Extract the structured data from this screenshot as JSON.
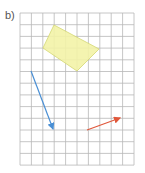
{
  "label": "b)",
  "grid": {
    "x0": 20,
    "y0": 13,
    "cols": 10,
    "rows": 13,
    "cell_w": 11.4,
    "cell_h": 11.7,
    "line_color": "#b8b8b8"
  },
  "shape": {
    "type": "quadrilateral",
    "points": "54,25 99,49 77,71 43,48",
    "fill": "#f3f3a8",
    "stroke": "#d9dc7a"
  },
  "vectors": [
    {
      "name": "blue-vector",
      "x1": 31,
      "y1": 71,
      "x2": 53,
      "y2": 129,
      "color": "#4a8fd4"
    },
    {
      "name": "red-vector",
      "x1": 87,
      "y1": 130,
      "x2": 120,
      "y2": 118,
      "color": "#e0573a"
    }
  ]
}
